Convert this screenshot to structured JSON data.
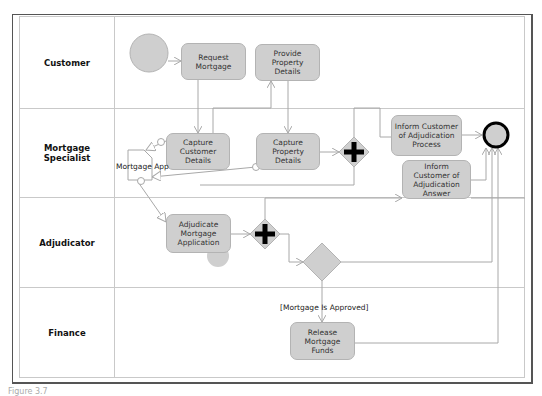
{
  "diagram": {
    "type": "BPMN process (swimlanes)",
    "lanes": [
      {
        "name": "Customer"
      },
      {
        "name": "Mortgage Specialist"
      },
      {
        "name": "Adjudicator"
      },
      {
        "name": "Finance"
      }
    ],
    "tasks": {
      "request_mortgage": "Request Mortgage",
      "provide_property_details": "Provide Property Details",
      "capture_customer_details": "Capture Customer Details",
      "capture_property_details": "Capture Property Details",
      "inform_adjudication_process": "Inform Customer of Adjudication Process",
      "inform_adjudication_answer": "Inform Customer of Adjudication Answer",
      "adjudicate_mortgage_application": "Adjudicate Mortgage Application",
      "release_mortgage_funds": "Release Mortgage Funds"
    },
    "data_object": "Mortgage App",
    "condition_label": "[Mortgage Is Approved]",
    "events": {
      "start": "start-event",
      "end": "end-event"
    },
    "gateways": [
      "parallel-gateway",
      "parallel-gateway",
      "exclusive-gateway"
    ],
    "colors": {
      "task_fill": "#cfcfcf",
      "task_border": "#b3b3b3",
      "line": "#a8a8a8",
      "gateway_mark": "#000000"
    }
  },
  "caption": "Figure 3.7"
}
